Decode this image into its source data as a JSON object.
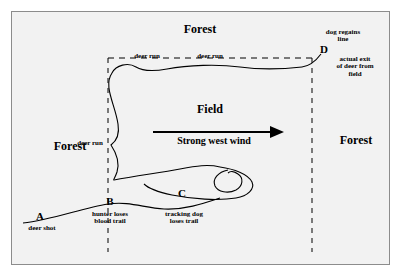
{
  "figure": {
    "background_color": "#f2f2f2",
    "border_color": "#8c8c8c",
    "ink_color": "#000000"
  },
  "labels": {
    "forest_top": "Forest",
    "forest_left": "Forest",
    "forest_right": "Forest",
    "field": "Field",
    "wind": "Strong west wind",
    "deer_run_top_left": "deer run",
    "deer_run_top_right": "deer run",
    "deer_run_left": "deer run"
  },
  "points": [
    {
      "id": "A",
      "label": "A",
      "caption": "deer shot"
    },
    {
      "id": "B",
      "label": "B",
      "caption": "hunter loses\nblood trail"
    },
    {
      "id": "C",
      "label": "C",
      "caption": "tracking dog\nloses trail"
    },
    {
      "id": "D",
      "label": "D",
      "caption_above": "dog regains\nline",
      "caption_below": "actual exit\nof deer from\nfield"
    }
  ]
}
